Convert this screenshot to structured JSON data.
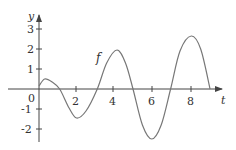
{
  "chart_data": {
    "type": "line",
    "title": "",
    "xlabel": "t",
    "ylabel": "y",
    "xlim": [
      -1.2,
      9.9
    ],
    "ylim": [
      -2.7,
      3.6
    ],
    "grid": false,
    "legend": null,
    "x_ticks": [
      2,
      4,
      6,
      8
    ],
    "x_tick_labels": [
      "2",
      "4",
      "6",
      "8"
    ],
    "y_ticks": [
      -2,
      -1,
      1,
      2,
      3
    ],
    "y_tick_labels": [
      "-2",
      "-1",
      "1",
      "2",
      "3"
    ],
    "origin_label": "0",
    "annotations": [
      {
        "text": "f",
        "x": 3.2,
        "y": 1.55
      }
    ],
    "series": [
      {
        "name": "f",
        "x": [
          0,
          0.3,
          0.7,
          1.1,
          1.6,
          2.0,
          2.5,
          3.1,
          3.6,
          4.15,
          4.6,
          5.0,
          5.5,
          6.0,
          6.5,
          7.0,
          7.5,
          8.1,
          8.6,
          9.1
        ],
        "y": [
          0.15,
          0.5,
          0.35,
          0.0,
          -0.95,
          -1.45,
          -1.1,
          0.0,
          1.3,
          1.95,
          1.3,
          0.0,
          -1.8,
          -2.5,
          -1.8,
          0.0,
          1.9,
          2.65,
          2.0,
          0.0
        ]
      }
    ]
  },
  "labels": {
    "y_axis": "y",
    "t_axis": "t",
    "origin": "0",
    "function": "f",
    "ticks_x": [
      "2",
      "4",
      "6",
      "8"
    ],
    "ticks_y": [
      "3",
      "2",
      "1",
      "-1",
      "-2"
    ]
  },
  "colors": {
    "curve": "#777777",
    "axis": "#444444",
    "text": "#333333"
  }
}
